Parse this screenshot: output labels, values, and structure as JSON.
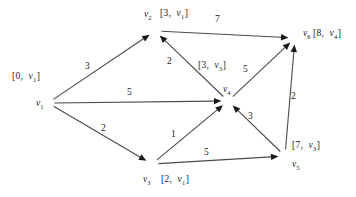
{
  "figure": {
    "type": "directed-weighted-graph",
    "width": 356,
    "height": 197,
    "background_color": "#ffffff",
    "edge_color": "#4a4a4a",
    "text_color": "#1a1a1a"
  },
  "nodes": [
    {
      "id": "v1",
      "name": "v",
      "subscript": "1",
      "x": 48,
      "y": 103,
      "name_label_x": 36,
      "name_label_y": 99,
      "dist": "0",
      "pred": "v",
      "pred_sub": "1",
      "bracket_label": "[0,  v₁]",
      "bracket_x": 12,
      "bracket_y": 72
    },
    {
      "id": "v2",
      "name": "v",
      "subscript": "2",
      "x": 155,
      "y": 31,
      "name_label_x": 144,
      "name_label_y": 10,
      "dist": "3",
      "pred": "v",
      "pred_sub": "1",
      "bracket_label": "[3,  v₁]",
      "bracket_x": 160,
      "bracket_y": 9
    },
    {
      "id": "v3",
      "name": "v",
      "subscript": "3",
      "x": 152,
      "y": 164,
      "name_label_x": 143,
      "name_label_y": 175,
      "dist": "2",
      "pred": "v",
      "pred_sub": "1",
      "bracket_label": "[2, v₁]",
      "bracket_x": 161,
      "bracket_y": 175
    },
    {
      "id": "v4",
      "name": "v",
      "subscript": "4",
      "x": 228,
      "y": 101,
      "name_label_x": 223,
      "name_label_y": 85,
      "dist": "3",
      "pred": "v",
      "pred_sub": "3",
      "bracket_label": "[3,  v₃]",
      "bracket_x": 198,
      "bracket_y": 61
    },
    {
      "id": "v5",
      "name": "v",
      "subscript": "5",
      "x": 285,
      "y": 156,
      "name_label_x": 292,
      "name_label_y": 160,
      "dist": "7",
      "pred": "v",
      "pred_sub": "3",
      "bracket_label": "[7,  v₃]",
      "bracket_x": 292,
      "bracket_y": 141
    },
    {
      "id": "v6",
      "name": "v",
      "subscript": "6",
      "x": 295,
      "y": 38,
      "name_label_x": 303,
      "name_label_y": 29,
      "dist": "8",
      "pred": "v",
      "pred_sub": "4",
      "bracket_label": "[8,  v₄]",
      "bracket_x": 313,
      "bracket_y": 29
    }
  ],
  "edges": [
    {
      "id": "e-v1-v2",
      "from": "v1",
      "to": "v2",
      "weight": "3",
      "label_x": 85,
      "label_y": 62
    },
    {
      "id": "e-v1-v4",
      "from": "v1",
      "to": "v4",
      "weight": "5",
      "label_x": 127,
      "label_y": 88
    },
    {
      "id": "e-v1-v3",
      "from": "v1",
      "to": "v3",
      "weight": "2",
      "label_x": 101,
      "label_y": 124
    },
    {
      "id": "e-v2-v6",
      "from": "v2",
      "to": "v6",
      "weight": "7",
      "label_x": 215,
      "label_y": 15
    },
    {
      "id": "e-v4-v2",
      "from": "v4",
      "to": "v2",
      "weight": "2",
      "label_x": 167,
      "label_y": 57
    },
    {
      "id": "e-v4-v6",
      "from": "v4",
      "to": "v6",
      "weight": "5",
      "label_x": 243,
      "label_y": 65
    },
    {
      "id": "e-v3-v4",
      "from": "v3",
      "to": "v4",
      "weight": "1",
      "label_x": 171,
      "label_y": 130
    },
    {
      "id": "e-v3-v5",
      "from": "v3",
      "to": "v5",
      "weight": "5",
      "label_x": 204,
      "label_y": 148
    },
    {
      "id": "e-v5-v4",
      "from": "v5",
      "to": "v4",
      "weight": "3",
      "label_x": 248,
      "label_y": 112
    },
    {
      "id": "e-v5-v6",
      "from": "v5",
      "to": "v6",
      "weight": "2",
      "label_x": 291,
      "label_y": 92
    }
  ],
  "chart_data": {
    "type": "diagram",
    "title": "",
    "graph_type": "directed weighted graph",
    "vertices": [
      "v1",
      "v2",
      "v3",
      "v4",
      "v5",
      "v6"
    ],
    "vertex_labels": {
      "v1": "[0, v1]",
      "v2": "[3, v1]",
      "v3": "[2, v1]",
      "v4": "[3, v3]",
      "v5": "[7, v3]",
      "v6": "[8, v4]"
    },
    "edges": [
      {
        "source": "v1",
        "target": "v2",
        "weight": 3
      },
      {
        "source": "v1",
        "target": "v4",
        "weight": 5
      },
      {
        "source": "v1",
        "target": "v3",
        "weight": 2
      },
      {
        "source": "v2",
        "target": "v6",
        "weight": 7
      },
      {
        "source": "v4",
        "target": "v2",
        "weight": 2
      },
      {
        "source": "v4",
        "target": "v6",
        "weight": 5
      },
      {
        "source": "v3",
        "target": "v4",
        "weight": 1
      },
      {
        "source": "v3",
        "target": "v5",
        "weight": 5
      },
      {
        "source": "v5",
        "target": "v4",
        "weight": 3
      },
      {
        "source": "v5",
        "target": "v6",
        "weight": 2
      }
    ]
  }
}
